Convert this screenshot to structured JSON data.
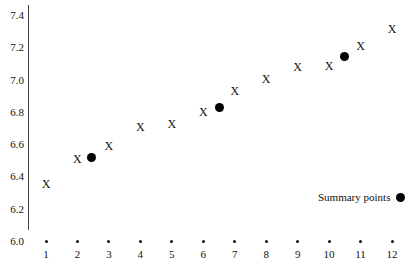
{
  "chart_data": {
    "type": "scatter",
    "title": "",
    "xlabel": "",
    "ylabel": "",
    "xlim": [
      1,
      12
    ],
    "ylim": [
      6.0,
      7.4
    ],
    "grid": false,
    "x_ticks": [
      "1",
      "2",
      "3",
      "4",
      "5",
      "6",
      "7",
      "8",
      "9",
      "10",
      "11",
      "12"
    ],
    "y_ticks": [
      "6.0",
      "6.2",
      "6.4",
      "6.6",
      "6.8",
      "7.0",
      "7.2",
      "7.4"
    ],
    "series": [
      {
        "name": "Observations",
        "marker": "X",
        "x": [
          1,
          2,
          3,
          4,
          5,
          6,
          7,
          8,
          9,
          10,
          11,
          12
        ],
        "y": [
          6.35,
          6.5,
          6.58,
          6.7,
          6.72,
          6.79,
          6.92,
          7.0,
          7.07,
          7.08,
          7.2,
          7.31
        ]
      },
      {
        "name": "Summary points",
        "marker": "filled-circle",
        "x": [
          2.45,
          6.5,
          10.5
        ],
        "y": [
          6.52,
          6.83,
          7.14
        ]
      }
    ],
    "legend": {
      "position": "lower-right",
      "entries": [
        "Summary points"
      ]
    }
  },
  "legend": {
    "label": "Summary points"
  },
  "marker_symbol": "X"
}
